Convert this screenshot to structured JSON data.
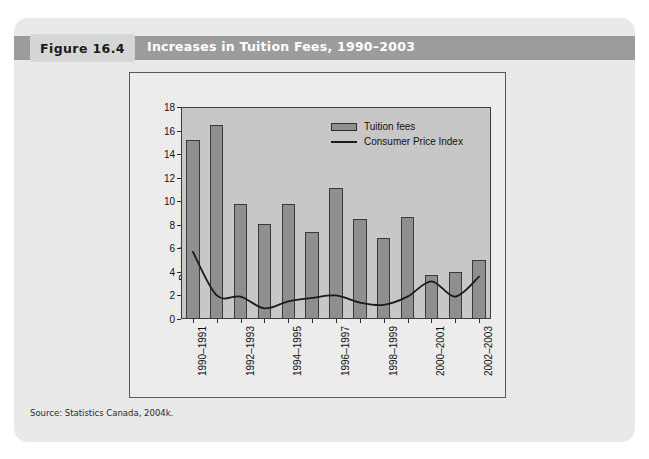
{
  "figure": {
    "tag": "Figure 16.4",
    "title": "Increases in Tuition Fees, 1990–2003",
    "source": "Source: Statistics Canada, 2004k."
  },
  "chart_data": {
    "type": "bar",
    "title": "Increases in Tuition Fees, 1990–2003",
    "xlabel": "",
    "ylabel": "Percentage increase",
    "ylim": [
      0,
      18
    ],
    "ytick_step": 2,
    "yticks": [
      0,
      2,
      4,
      6,
      8,
      10,
      12,
      14,
      16,
      18
    ],
    "grid": false,
    "legend_position": "top-center",
    "categories": [
      "1990–1991",
      "1991–1992",
      "1992–1993",
      "1993–1994",
      "1994–1995",
      "1995–1996",
      "1996–1997",
      "1997–1998",
      "1998–1999",
      "1999–2000",
      "2000–2001",
      "2001–2002",
      "2002–2003"
    ],
    "xtick_labels_shown": [
      "1990–1991",
      "1992–1993",
      "1994–1995",
      "1996–1997",
      "1998–1999",
      "2000–2001",
      "2002–2003"
    ],
    "series": [
      {
        "name": "Tuition fees",
        "kind": "bar",
        "color": "#8f8f8f",
        "values": [
          15.2,
          16.5,
          9.8,
          8.1,
          9.8,
          7.4,
          11.1,
          8.5,
          6.9,
          8.7,
          3.7,
          4.0,
          5.0
        ]
      },
      {
        "name": "Consumer Price Index",
        "kind": "line",
        "color": "#1a1a1a",
        "values": [
          5.7,
          2.0,
          1.9,
          0.9,
          1.5,
          1.8,
          2.0,
          1.4,
          1.2,
          1.9,
          3.2,
          1.9,
          3.6
        ]
      }
    ]
  },
  "legend": {
    "items": [
      {
        "label": "Tuition fees"
      },
      {
        "label": "Consumer Price Index"
      }
    ]
  },
  "colors": {
    "header_bar": "#9c9c9c",
    "card_background": "#e9e9e9",
    "plot_background": "#c7c7c7",
    "bar_fill": "#8f8f8f",
    "line_stroke": "#1a1a1a"
  }
}
